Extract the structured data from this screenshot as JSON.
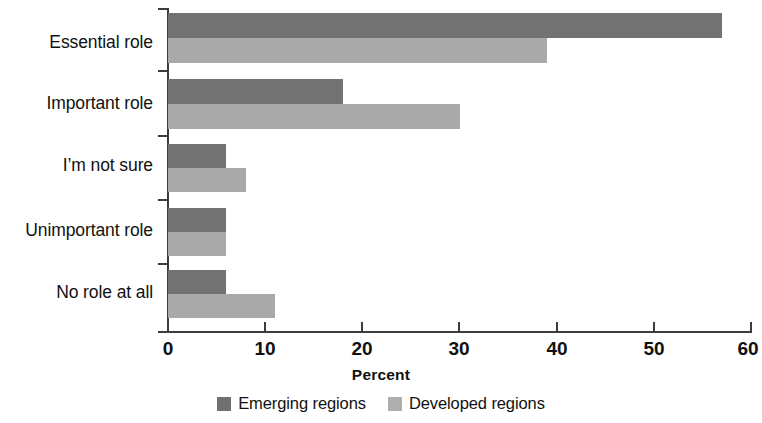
{
  "chart_data": {
    "type": "bar",
    "orientation": "horizontal",
    "title": "",
    "xlabel": "Percent",
    "ylabel": "",
    "xlim": [
      0,
      60
    ],
    "xticks": [
      0,
      10,
      20,
      30,
      40,
      50,
      60
    ],
    "xtick_labels": [
      "0",
      "10",
      "20",
      "30",
      "40",
      "50",
      "60"
    ],
    "grid": false,
    "legend_position": "bottom-center",
    "categories": [
      "Essential role",
      "Important role",
      "I’m not sure",
      "Unimportant role",
      "No role at all"
    ],
    "series": [
      {
        "name": "Emerging regions",
        "color": "#727272",
        "values": [
          57,
          18,
          6,
          6,
          6
        ]
      },
      {
        "name": "Developed regions",
        "color": "#a9a9a9",
        "values": [
          39,
          30,
          8,
          6,
          11
        ]
      }
    ]
  },
  "axis": {
    "x_title": "Percent"
  }
}
